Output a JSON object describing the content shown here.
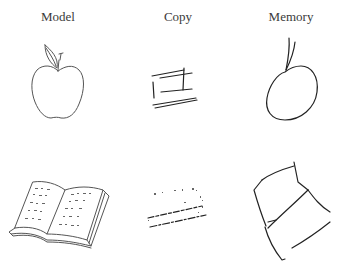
{
  "columns": [
    {
      "label": "Model"
    },
    {
      "label": "Copy"
    },
    {
      "label": "Memory"
    }
  ],
  "rows": [
    {
      "object": "apple",
      "cells": [
        "apple-model-drawing",
        "apple-copy-drawing",
        "apple-memory-drawing"
      ]
    },
    {
      "object": "book",
      "cells": [
        "book-model-drawing",
        "book-copy-drawing",
        "book-memory-drawing"
      ]
    }
  ]
}
